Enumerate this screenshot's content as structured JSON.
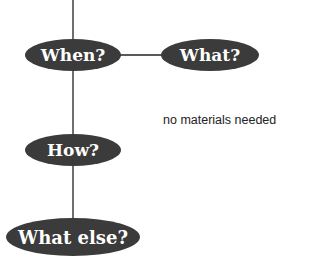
{
  "diagram": {
    "colors": {
      "node_fill": "#3b3b3b",
      "connector": "#222222",
      "label": "#ffffff"
    },
    "nodes": {
      "when": {
        "label": "When?"
      },
      "what": {
        "label": "What?"
      },
      "how": {
        "label": "How?"
      },
      "what_else": {
        "label": "What else?"
      }
    },
    "annotation": "no materials needed"
  }
}
